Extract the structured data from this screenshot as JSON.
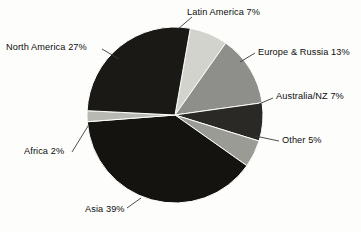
{
  "chart_data": {
    "type": "pie",
    "title": "",
    "xlabel": "",
    "ylabel": "",
    "legend_position": "none",
    "grid": false,
    "value_unit": "%",
    "start_angle_deg": -80,
    "direction": "clockwise",
    "categories": [
      "Latin America",
      "Europe & Russia",
      "Australia/NZ",
      "Other",
      "Asia",
      "Africa",
      "North America"
    ],
    "values": [
      7,
      13,
      7,
      5,
      39,
      2,
      27
    ],
    "slices": [
      {
        "name": "Latin America",
        "value": 7,
        "label": "Latin America 7%",
        "color": "#d3d3ce",
        "start_deg": -80,
        "end_deg": -54.8,
        "leader": {
          "x1": 178,
          "y1": 29,
          "x2": 192,
          "y2": 17
        }
      },
      {
        "name": "Europe & Russia",
        "value": 13,
        "label": "Europe & Russia 13%",
        "color": "#8e8e8a",
        "start_deg": -54.8,
        "end_deg": -8,
        "leader": {
          "x1": 240,
          "y1": 62,
          "x2": 255,
          "y2": 53
        }
      },
      {
        "name": "Australia/NZ",
        "value": 7,
        "label": "Australia/NZ 7%",
        "color": "#2b2926",
        "start_deg": -8,
        "end_deg": 17.2,
        "leader": {
          "x1": 259,
          "y1": 104,
          "x2": 273,
          "y2": 98
        }
      },
      {
        "name": "Other",
        "value": 5,
        "label": "Other 5%",
        "color": "#9b9b96",
        "start_deg": 17.2,
        "end_deg": 35.2,
        "leader": {
          "x1": 255,
          "y1": 136,
          "x2": 279,
          "y2": 141
        }
      },
      {
        "name": "Asia",
        "value": 39,
        "label": "Asia 39%",
        "color": "#151310",
        "start_deg": 35.2,
        "end_deg": 175.6,
        "leader": {
          "x1": 141,
          "y1": 198,
          "x2": 127,
          "y2": 208
        }
      },
      {
        "name": "Africa",
        "value": 2,
        "label": "Africa 2%",
        "color": "#b9b9b4",
        "start_deg": 175.6,
        "end_deg": 182.8,
        "leader": {
          "x1": 88,
          "y1": 126,
          "x2": 72,
          "y2": 152
        }
      },
      {
        "name": "North America",
        "value": 27,
        "label": "North America 27%",
        "color": "#1b1916",
        "start_deg": 182.8,
        "end_deg": 280,
        "leader": {
          "x1": 119,
          "y1": 59,
          "x2": 102,
          "y2": 49
        }
      }
    ],
    "geometry": {
      "center_x": 175,
      "center_y": 115,
      "radius": 88
    },
    "colors": {
      "background": "#fdfdfb",
      "text": "#0d0d0d",
      "leader_line": "#3a3a38",
      "outline": "#6b6b68"
    }
  }
}
